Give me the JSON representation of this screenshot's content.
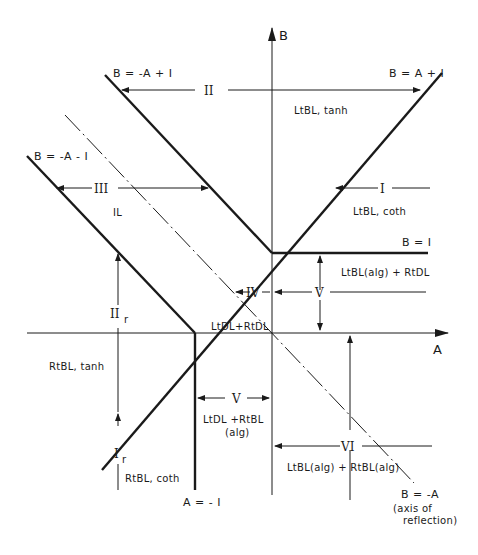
{
  "axes": {
    "horizontal_label": "A",
    "vertical_label": "B"
  },
  "lines": {
    "b_eq_neg_a_plus_1": "B = -A + I",
    "b_eq_a_plus_1": "B = A + I",
    "b_eq_neg_a_minus_1": "B = -A - I",
    "b_eq_1": "B = I",
    "a_eq_neg_1": "A = - I",
    "b_eq_neg_a": "B = -A",
    "axis_of_reflection_line1": "(axis of",
    "axis_of_reflection_line2": "reflection)"
  },
  "regions": {
    "II": {
      "numeral": "II",
      "description": "LtBL, tanh"
    },
    "I": {
      "numeral": "I",
      "description": "LtBL, coth"
    },
    "III": {
      "numeral": "III",
      "description": "IL"
    },
    "V_upper": {
      "numeral": "V",
      "description": "LtBL(alg) + RtDL"
    },
    "IV": {
      "numeral": "IV",
      "description": "LtDL+RtDL"
    },
    "II_r": {
      "numeral": "II",
      "subscript": "r",
      "description": "RtBL, tanh"
    },
    "I_r": {
      "numeral": "I",
      "subscript": "r",
      "description": "RtBL, coth"
    },
    "V_lower": {
      "numeral": "V",
      "description_line1": "LtDL +RtBL",
      "description_line2": "(alg)"
    },
    "VI": {
      "numeral": "VI",
      "description": "LtBL(alg) + RtBL(alg)"
    }
  },
  "colors": {
    "ink": "#1a1a1a",
    "background": "#ffffff"
  }
}
